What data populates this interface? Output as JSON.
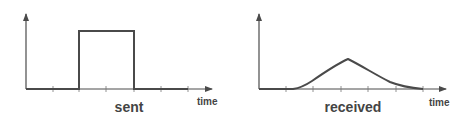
{
  "diagram": {
    "colors": {
      "stroke": "#4a4a4a",
      "text": "#444444",
      "background": "#ffffff"
    },
    "panels": [
      {
        "id": "sent",
        "label": "sent",
        "axis_label": "time",
        "signal": "rectangular pulse"
      },
      {
        "id": "received",
        "label": "received",
        "axis_label": "time",
        "signal": "smoothed triangular pulse"
      }
    ]
  }
}
